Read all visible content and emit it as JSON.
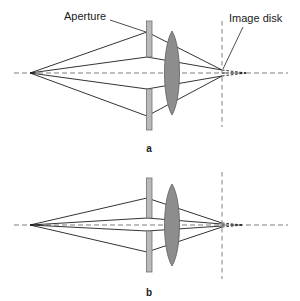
{
  "figure": {
    "panels": [
      {
        "id": "a",
        "letter": "a",
        "description": "Wide aperture produces a large image disk",
        "labels": [
          {
            "name": "aperture",
            "text": "Aperture"
          },
          {
            "name": "image-disk",
            "text": "Image disk"
          }
        ],
        "elements": {
          "source_point": "point source on optical axis at left",
          "aperture": "wide slit stop",
          "lens": "biconvex converging lens",
          "image_plane": "dashed vertical image plane",
          "image_disk": "large blur disk"
        }
      },
      {
        "id": "b",
        "letter": "b",
        "description": "Narrow aperture produces a small image disk",
        "labels": [],
        "elements": {
          "source_point": "point source on optical axis at left",
          "aperture": "narrow slit stop",
          "lens": "biconvex converging lens",
          "image_plane": "dashed vertical image plane",
          "image_disk": "small blur disk"
        }
      }
    ],
    "colors": {
      "background": "#ffffff",
      "ray": "#1d1d1d",
      "axis": "#6e6e6e",
      "plane": "#8c8c8c",
      "aperture_fill": "#b9b9b9",
      "aperture_stroke": "#717171",
      "lens_fill": "#8d8d8d",
      "lens_stroke": "#5d5d5d",
      "text": "#1a1a1a"
    }
  },
  "panel_a": {
    "aperture_label": "Aperture",
    "image_disk_label": "Image disk",
    "letter": "a"
  },
  "panel_b": {
    "letter": "b"
  }
}
